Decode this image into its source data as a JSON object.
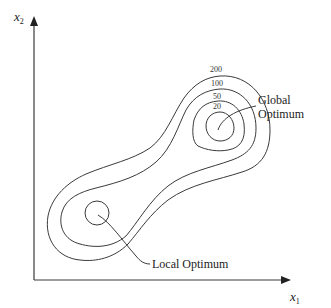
{
  "axes": {
    "x": {
      "var": "x",
      "sub": "1"
    },
    "y": {
      "var": "x",
      "sub": "2"
    }
  },
  "contour_levels": [
    "200",
    "100",
    "50",
    "20"
  ],
  "annotations": {
    "global": [
      "Global",
      "Optimum"
    ],
    "local": "Local Optimum"
  },
  "colors": {
    "line": "#3a3a3a",
    "text": "#222222",
    "background": "#ffffff"
  }
}
